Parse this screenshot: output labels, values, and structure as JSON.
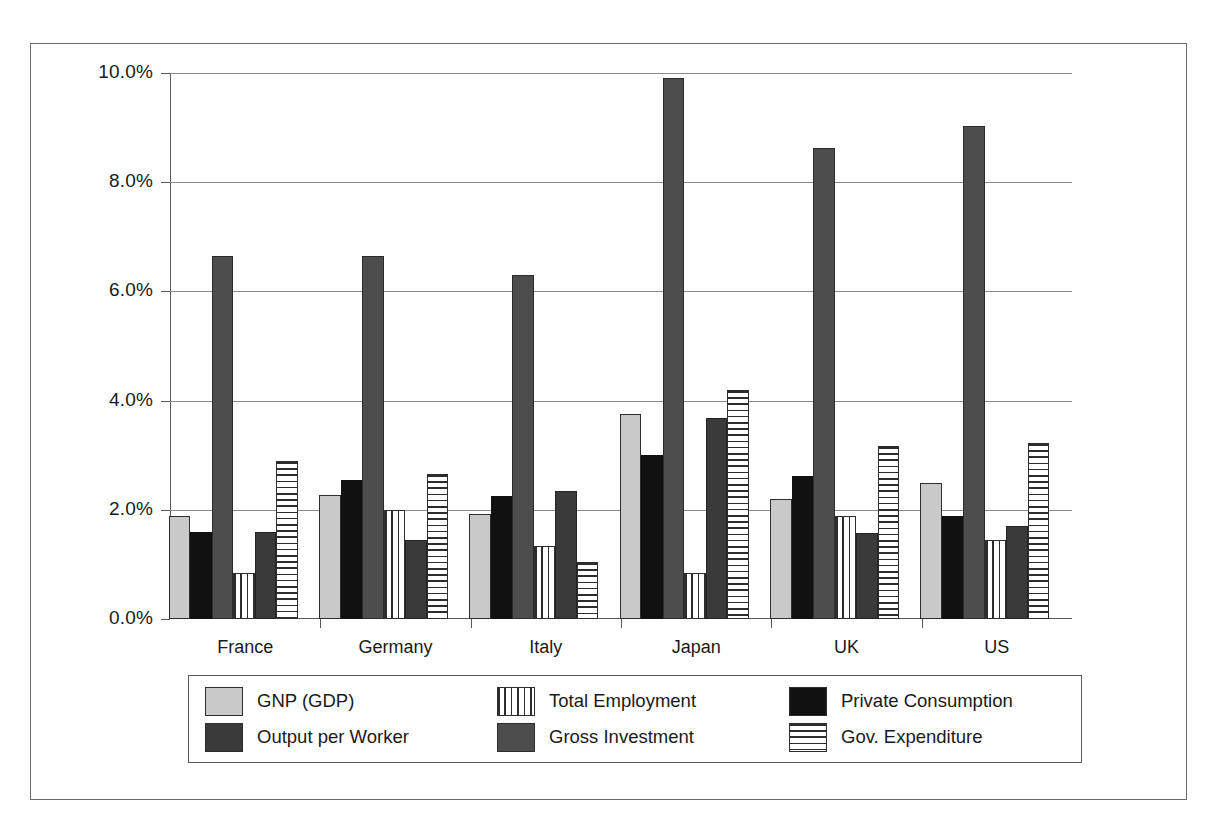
{
  "chart_data": {
    "type": "bar",
    "title": "",
    "subtitle": "",
    "xlabel": "",
    "ylabel": "",
    "ylim": [
      0,
      10
    ],
    "ytick_labels": [
      "0.0%",
      "2.0%",
      "4.0%",
      "6.0%",
      "8.0%",
      "10.0%"
    ],
    "ytick_values": [
      0,
      2,
      4,
      6,
      8,
      10
    ],
    "grid": true,
    "legend_position": "bottom",
    "categories": [
      "France",
      "Germany",
      "Italy",
      "Japan",
      "UK",
      "US"
    ],
    "series": [
      {
        "name": "GNP (GDP)",
        "key": "gnp",
        "color": "#c9c9c9",
        "pattern": "solid",
        "values": [
          1.88,
          2.28,
          1.93,
          3.75,
          2.2,
          2.5
        ]
      },
      {
        "name": "Private Consumption",
        "key": "priv",
        "color": "#111111",
        "pattern": "solid",
        "values": [
          1.6,
          2.55,
          2.25,
          3.0,
          2.62,
          1.88
        ]
      },
      {
        "name": "Gross Investment",
        "key": "gross",
        "color": "#4d4d4d",
        "pattern": "solid",
        "values": [
          6.65,
          6.65,
          6.3,
          9.9,
          8.62,
          9.03
        ]
      },
      {
        "name": "Total Employment",
        "key": "emp",
        "color": "#ffffff",
        "pattern": "vertical-stripes",
        "values": [
          0.85,
          2.0,
          1.33,
          0.85,
          1.88,
          1.45
        ]
      },
      {
        "name": "Output per Worker",
        "key": "opw",
        "color": "#3a3a3a",
        "pattern": "solid",
        "values": [
          1.6,
          1.45,
          2.35,
          3.68,
          1.58,
          1.7
        ]
      },
      {
        "name": "Gov. Expenditure",
        "key": "gov",
        "color": "#ffffff",
        "pattern": "horizontal-stripes",
        "values": [
          2.9,
          2.65,
          1.05,
          4.2,
          3.17,
          3.23
        ]
      }
    ]
  },
  "legend": {
    "items": [
      {
        "label": "GNP (GDP)",
        "swatch": "sw-gnp"
      },
      {
        "label": "Private Consumption",
        "swatch": "sw-priv"
      },
      {
        "label": "Gross Investment",
        "swatch": "sw-gross"
      },
      {
        "label": "Total Employment",
        "swatch": "sw-emp"
      },
      {
        "label": "Output per Worker",
        "swatch": "sw-opw"
      },
      {
        "label": "Gov. Expenditure",
        "swatch": "sw-gov"
      }
    ]
  }
}
